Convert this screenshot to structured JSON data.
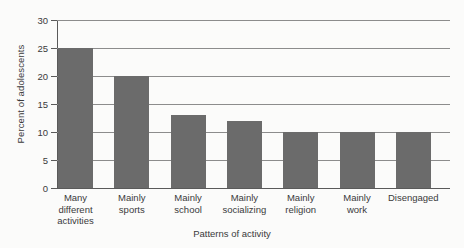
{
  "chart_data": {
    "type": "bar",
    "title": "",
    "xlabel": "Patterns of activity",
    "ylabel": "Percent of adolescents",
    "categories": [
      "Many different activities",
      "Mainly sports",
      "Mainly school",
      "Mainly socializing",
      "Mainly religion",
      "Mainly work",
      "Disengaged"
    ],
    "category_lines": [
      [
        "Many",
        "different",
        "activities"
      ],
      [
        "Mainly",
        "sports"
      ],
      [
        "Mainly",
        "school"
      ],
      [
        "Mainly",
        "socializing"
      ],
      [
        "Mainly",
        "religion"
      ],
      [
        "Mainly",
        "work"
      ],
      [
        "Disengaged"
      ]
    ],
    "values": [
      25,
      20,
      13,
      12,
      10,
      10,
      10
    ],
    "ylim": [
      0,
      30
    ],
    "yticks": [
      0,
      5,
      10,
      15,
      20,
      25,
      30
    ],
    "ytick_labels": [
      "0",
      "5",
      "10",
      "15",
      "20",
      "25",
      "30"
    ],
    "grid": true,
    "legend": false,
    "bar_color": "#6b6b6b",
    "grid_color": "#8c8c8c",
    "axis_color": "#5a5a5a",
    "background_color": "#fbfbfa"
  }
}
